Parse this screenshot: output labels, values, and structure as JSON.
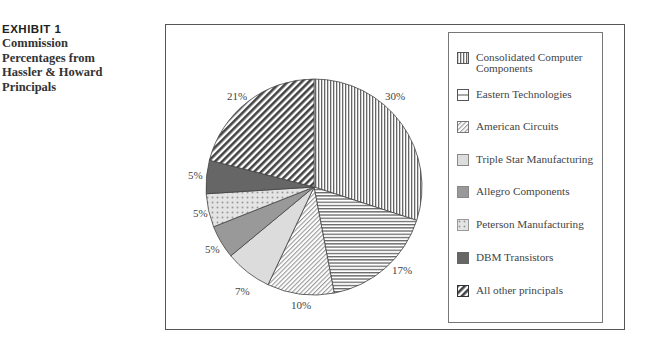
{
  "caption": {
    "exhibit": "EXHIBIT 1",
    "title_lines": [
      "Commission",
      "Percentages from",
      "Hassler & Howard",
      "Principals"
    ]
  },
  "chart_data": {
    "type": "pie",
    "title": "Commission Percentages from Hassler & Howard Principals",
    "start_angle": "12 o'clock",
    "direction": "clockwise",
    "legend_position": "right",
    "categories": [
      "Consolidated Computer Components",
      "Eastern Technologies",
      "American Circuits",
      "Triple Star Manufacturing",
      "Allegro Components",
      "Peterson Manufacturing",
      "DBM Transistors",
      "All other principals"
    ],
    "values": [
      30,
      17,
      10,
      7,
      5,
      5,
      5,
      21
    ],
    "labels": [
      "30%",
      "17%",
      "10%",
      "7%",
      "5%",
      "5%",
      "5%",
      "21%"
    ],
    "patterns": [
      "vertical-lines",
      "horizontal-lines",
      "diagonal-light",
      "light-gray",
      "medium-gray",
      "dots",
      "dark-gray",
      "diagonal-dark"
    ]
  },
  "legend": {
    "items": [
      {
        "line1": "Consolidated Computer",
        "line2": "Components"
      },
      {
        "line1": "Eastern Technologies",
        "line2": ""
      },
      {
        "line1": "American Circuits",
        "line2": ""
      },
      {
        "line1": "Triple Star Manufacturing",
        "line2": ""
      },
      {
        "line1": "Allegro Components",
        "line2": ""
      },
      {
        "line1": "Peterson Manufacturing",
        "line2": ""
      },
      {
        "line1": "DBM Transistors",
        "line2": ""
      },
      {
        "line1": "All other principals",
        "line2": ""
      }
    ]
  },
  "slice_labels": [
    "30%",
    "17%",
    "10%",
    "7%",
    "5%",
    "5%",
    "5%",
    "21%"
  ]
}
